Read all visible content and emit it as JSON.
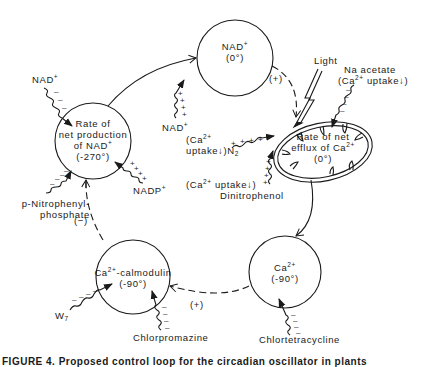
{
  "nodes": {
    "nad": {
      "line1": "NAD",
      "sup1": "+",
      "line2": "(0°)"
    },
    "nad_production": {
      "line1": "Rate of",
      "line2": "net production",
      "line3": "of NAD",
      "sup3": "+",
      "line4": "(-270°)"
    },
    "ca_efflux": {
      "line1": "Rate of net",
      "line2": "efflux of Ca",
      "sup2": "2+",
      "line3": "(0°)"
    },
    "ca": {
      "line1": "Ca",
      "sup1": "2+",
      "line2": "(-90°)"
    },
    "calmodulin": {
      "line1a": "Ca",
      "sup1": "2+",
      "line1b": "-calmodulin",
      "line2": "(-90°)"
    }
  },
  "edge_labels": {
    "nad_to_efflux": "(+)",
    "calmodulin_to_production": "(−)",
    "ca_to_calmodulin": "(+)"
  },
  "effectors": {
    "nad_left": {
      "text": "NAD",
      "sup": "+"
    },
    "nad_bottom": {
      "text": "NAD",
      "sup": "+"
    },
    "nadp": {
      "text": "NADP",
      "sup": "+"
    },
    "nitrophenyl_line1": "p-Nitrophenyl-",
    "nitrophenyl_line2": "phosphate",
    "w7": {
      "text": "W",
      "sub": "7"
    },
    "chlorpromazine": "Chlorpromazine",
    "chlortetracycline": "Chlortetracycline",
    "light": "Light",
    "na_acetate_line1": "Na acetate",
    "na_acetate_line2a": "(Ca",
    "na_acetate_sup": "2+",
    "na_acetate_line2b": " uptake↓)",
    "n2_line1a": "(Ca",
    "n2_sup": "2+",
    "n2_line2a": "uptake↓)N",
    "n2_sub": "2",
    "dnp_line1a": "(Ca",
    "dnp_sup": "2+",
    "dnp_line1b": " uptake↓)",
    "dnp_line2": "Dinitrophenol"
  },
  "caption": "FIGURE 4. Proposed control loop for the circadian oscillator in plants"
}
